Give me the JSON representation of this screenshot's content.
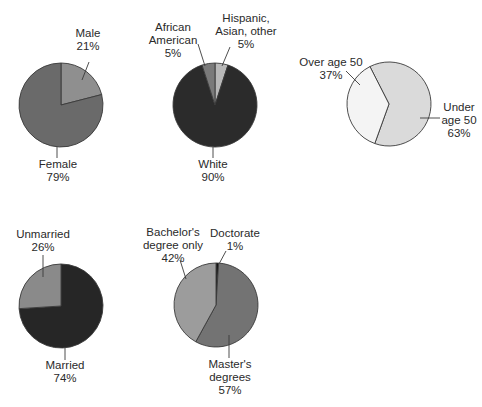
{
  "chart_data": [
    {
      "type": "pie",
      "id": "gender",
      "title": "",
      "center": [
        61,
        105
      ],
      "radius": 42,
      "start_angle_deg": 0,
      "slices": [
        {
          "label": "Male",
          "value": 21,
          "value_label": "21%",
          "color": "#8f8f8f",
          "label_lines": [
            "Male",
            "21%"
          ],
          "label_pos": [
            88,
            37
          ],
          "anchor": "middle",
          "leader": [
            [
              89,
              62
            ],
            [
              82,
              80
            ]
          ]
        },
        {
          "label": "Female",
          "value": 79,
          "value_label": "79%",
          "color": "#6a6a6a",
          "label_lines": [
            "Female",
            "79%"
          ],
          "label_pos": [
            58,
            168
          ],
          "anchor": "middle",
          "leader": [
            [
              57,
              147
            ],
            [
              57,
              158
            ]
          ]
        }
      ]
    },
    {
      "type": "pie",
      "id": "ethnicity",
      "title": "",
      "center": [
        215,
        105
      ],
      "radius": 42,
      "start_angle_deg": 0,
      "slices": [
        {
          "label": "Hispanic, Asian, other",
          "value": 5,
          "value_label": "5%",
          "color": "#b8b8b8",
          "label_lines": [
            "Hispanic,",
            "Asian, other",
            "5%"
          ],
          "label_pos": [
            246,
            22
          ],
          "anchor": "middle",
          "leader": [
            [
              230,
              47
            ],
            [
              222,
              66
            ]
          ]
        },
        {
          "label": "White",
          "value": 90,
          "value_label": "90%",
          "color": "#2b2b2b",
          "label_lines": [
            "White",
            "90%"
          ],
          "label_pos": [
            213,
            168
          ],
          "anchor": "middle",
          "leader": [
            [
              213,
              147
            ],
            [
              213,
              158
            ]
          ]
        },
        {
          "label": "African American",
          "value": 5,
          "value_label": "5%",
          "color": "#7a7a7a",
          "label_lines": [
            "African",
            "American",
            "5%"
          ],
          "label_pos": [
            173,
            31
          ],
          "anchor": "middle",
          "leader": [
            [
              198,
              44
            ],
            [
              205,
              66
            ]
          ]
        }
      ]
    },
    {
      "type": "pie",
      "id": "age",
      "title": "",
      "center": [
        389,
        104
      ],
      "radius": 42,
      "start_angle_deg": -27,
      "slices": [
        {
          "label": "Under age 50",
          "value": 63,
          "value_label": "63%",
          "color": "#dadada",
          "label_lines": [
            "Under",
            "age 50",
            "63%"
          ],
          "label_pos": [
            459,
            111
          ],
          "anchor": "middle",
          "leader": [
            [
              420,
              118
            ],
            [
              440,
              118
            ]
          ]
        },
        {
          "label": "Over age 50",
          "value": 37,
          "value_label": "37%",
          "color": "#f4f4f4",
          "label_lines": [
            "Over age 50",
            "37%"
          ],
          "label_pos": [
            331,
            66
          ],
          "anchor": "middle",
          "leader": [
            [
              346,
              71
            ],
            [
              360,
              85
            ]
          ]
        }
      ]
    },
    {
      "type": "pie",
      "id": "marital_status",
      "title": "",
      "center": [
        61,
        306
      ],
      "radius": 42,
      "start_angle_deg": 0,
      "slices": [
        {
          "label": "Married",
          "value": 74,
          "value_label": "74%",
          "color": "#262626",
          "label_lines": [
            "Married",
            "74%"
          ],
          "label_pos": [
            65,
            369
          ],
          "anchor": "middle",
          "leader": [
            [
              65,
              347
            ],
            [
              65,
              360
            ]
          ]
        },
        {
          "label": "Unmarried",
          "value": 26,
          "value_label": "26%",
          "color": "#8a8a8a",
          "label_lines": [
            "Unmarried",
            "26%"
          ],
          "label_pos": [
            43,
            238
          ],
          "anchor": "middle",
          "leader": [
            [
              43,
              255
            ],
            [
              43,
              277
            ]
          ]
        }
      ]
    },
    {
      "type": "pie",
      "id": "education",
      "title": "",
      "center": [
        216,
        305
      ],
      "radius": 42,
      "start_angle_deg": 0,
      "slices": [
        {
          "label": "Doctorate",
          "value": 1,
          "value_label": "1%",
          "color": "#111111",
          "label_lines": [
            "Doctorate",
            "1%"
          ],
          "label_pos": [
            235,
            237
          ],
          "anchor": "middle",
          "leader": [
            [
              226,
              251
            ],
            [
              219,
              264
            ]
          ]
        },
        {
          "label": "Master's degrees",
          "value": 57,
          "value_label": "57%",
          "color": "#737373",
          "label_lines": [
            "Master's",
            "degrees",
            "57%"
          ],
          "label_pos": [
            230,
            368
          ],
          "anchor": "middle",
          "leader": [
            [
              229,
              335
            ],
            [
              229,
              358
            ]
          ]
        },
        {
          "label": "Bachelor's degree only",
          "value": 42,
          "value_label": "42%",
          "color": "#9c9c9c",
          "label_lines": [
            "Bachelor's",
            "degree only",
            "42%"
          ],
          "label_pos": [
            173,
            236
          ],
          "anchor": "middle",
          "leader": [
            [
              180,
              260
            ],
            [
              186,
              279
            ]
          ]
        }
      ]
    }
  ],
  "style": {
    "outline_color": "#3a3a3a",
    "leader_color": "#3a3a3a",
    "text_color": "#2a2a2a",
    "line_height": 13
  }
}
